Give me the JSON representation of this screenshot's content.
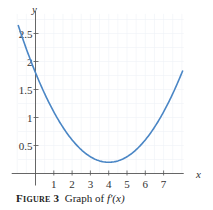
{
  "chart_data": {
    "type": "line",
    "title": "",
    "xlabel": "x",
    "ylabel": "y",
    "xlim": [
      -1,
      8
    ],
    "ylim": [
      0,
      2.8
    ],
    "x_ticks": [
      "1",
      "2",
      "3",
      "4",
      "5",
      "6",
      "7"
    ],
    "y_ticks": [
      "0.5",
      "1",
      "1.5",
      "2",
      "2.5"
    ],
    "grid": true,
    "legend": null,
    "series": [
      {
        "name": "f'(x)",
        "color": "#4a86c5",
        "x": [
          -0.95,
          0,
          1,
          2,
          3,
          4,
          5,
          6,
          7,
          8
        ],
        "y": [
          2.65,
          1.8,
          1.1,
          0.6,
          0.3,
          0.21,
          0.3,
          0.6,
          1.1,
          1.8
        ]
      }
    ]
  },
  "caption": {
    "label": "Figure",
    "number": "3",
    "text": "Graph of ",
    "function": "f′(x)"
  },
  "colors": {
    "curve": "#4a86c5",
    "axis": "#555555",
    "grid": "#eef1f6"
  }
}
